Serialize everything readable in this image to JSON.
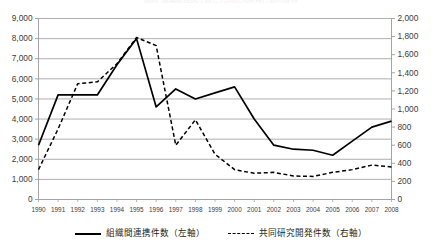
{
  "chart_data": {
    "type": "line",
    "title": "図表 組織間連携件数と共同研究開発件数の推移",
    "xlabel": "",
    "ylabel": "",
    "grid": true,
    "legend_position": "bottom",
    "x": [
      1990,
      1991,
      1992,
      1993,
      1994,
      1995,
      1996,
      1997,
      1998,
      1999,
      2000,
      2001,
      2002,
      2003,
      2004,
      2005,
      2006,
      2007,
      2008
    ],
    "categories": [
      "1990",
      "1991",
      "1992",
      "1993",
      "1994",
      "1995",
      "1996",
      "1997",
      "1998",
      "1999",
      "2000",
      "2001",
      "2002",
      "2003",
      "2004",
      "2005",
      "2006",
      "2007",
      "2008"
    ],
    "axes": {
      "left": {
        "label": "組織間連携件数（左軸）",
        "min": 0,
        "max": 9000,
        "step": 1000,
        "ticks": [
          "0",
          "1,000",
          "2,000",
          "3,000",
          "4,000",
          "5,000",
          "6,000",
          "7,000",
          "8,000",
          "9,000"
        ]
      },
      "right": {
        "label": "共同研究開発件数（右軸）",
        "min": 0,
        "max": 2000,
        "step": 200,
        "ticks": [
          "0",
          "200",
          "400",
          "600",
          "800",
          "1,000",
          "1,200",
          "1,400",
          "1,600",
          "1,800",
          "2,000"
        ]
      }
    },
    "series": [
      {
        "name": "組織間連携件数（左軸）",
        "axis": "left",
        "style": "solid",
        "color": "#000000",
        "values": [
          2700,
          5200,
          5200,
          5200,
          6700,
          8000,
          4600,
          5500,
          5000,
          5300,
          5600,
          4000,
          2700,
          2500,
          2450,
          2200,
          2900,
          3600,
          3900
        ]
      },
      {
        "name": "共同研究開発件数（右軸）",
        "axis": "right",
        "style": "dashed",
        "color": "#000000",
        "values": [
          330,
          780,
          1280,
          1300,
          1500,
          1790,
          1700,
          600,
          880,
          500,
          330,
          290,
          300,
          260,
          255,
          300,
          330,
          380,
          360
        ]
      }
    ]
  },
  "legend": {
    "entries": [
      {
        "label": "組織間連携件数（左軸）",
        "style": "solid"
      },
      {
        "label": "共同研究開発件数（右軸）",
        "style": "dashed"
      }
    ]
  }
}
